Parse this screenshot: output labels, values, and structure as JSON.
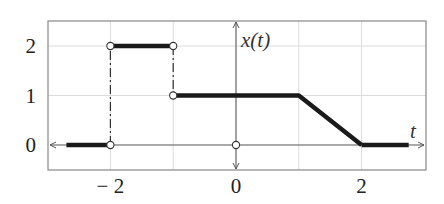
{
  "chart_data": {
    "type": "line",
    "title": "",
    "xlabel": "t",
    "ylabel": "x(t)",
    "xlim": [
      -2.95,
      3.05
    ],
    "ylim": [
      -0.5,
      2.5
    ],
    "grid": true,
    "x_ticks": [
      -2,
      -1,
      0,
      1,
      2
    ],
    "x_tick_labels": [
      "− 2",
      "",
      "0",
      "",
      "2"
    ],
    "y_ticks": [
      0,
      1,
      2
    ],
    "y_tick_labels": [
      "0",
      "1",
      "2"
    ],
    "series": [
      {
        "name": "x(t)",
        "segments": [
          {
            "x": [
              -2.7,
              -2
            ],
            "y": [
              0,
              0
            ]
          },
          {
            "x": [
              -2,
              -1
            ],
            "y": [
              2,
              2
            ]
          },
          {
            "x": [
              -1,
              1,
              2
            ],
            "y": [
              1,
              1,
              0
            ]
          },
          {
            "x": [
              2,
              2.75
            ],
            "y": [
              0,
              0
            ]
          }
        ],
        "discontinuities": [
          {
            "x": [
              -2,
              -2
            ],
            "y": [
              0,
              2
            ]
          },
          {
            "x": [
              -1,
              -1
            ],
            "y": [
              2,
              1
            ]
          }
        ],
        "open_points": [
          {
            "x": -2,
            "y": 0
          },
          {
            "x": -2,
            "y": 2
          },
          {
            "x": -1,
            "y": 2
          },
          {
            "x": -1,
            "y": 1
          },
          {
            "x": 0,
            "y": 0
          }
        ]
      }
    ],
    "colors": {
      "signal": "#1a1a1a",
      "axis": "#555555",
      "grid": "#dcdcdc",
      "frame": "#888888"
    },
    "legend": null
  }
}
